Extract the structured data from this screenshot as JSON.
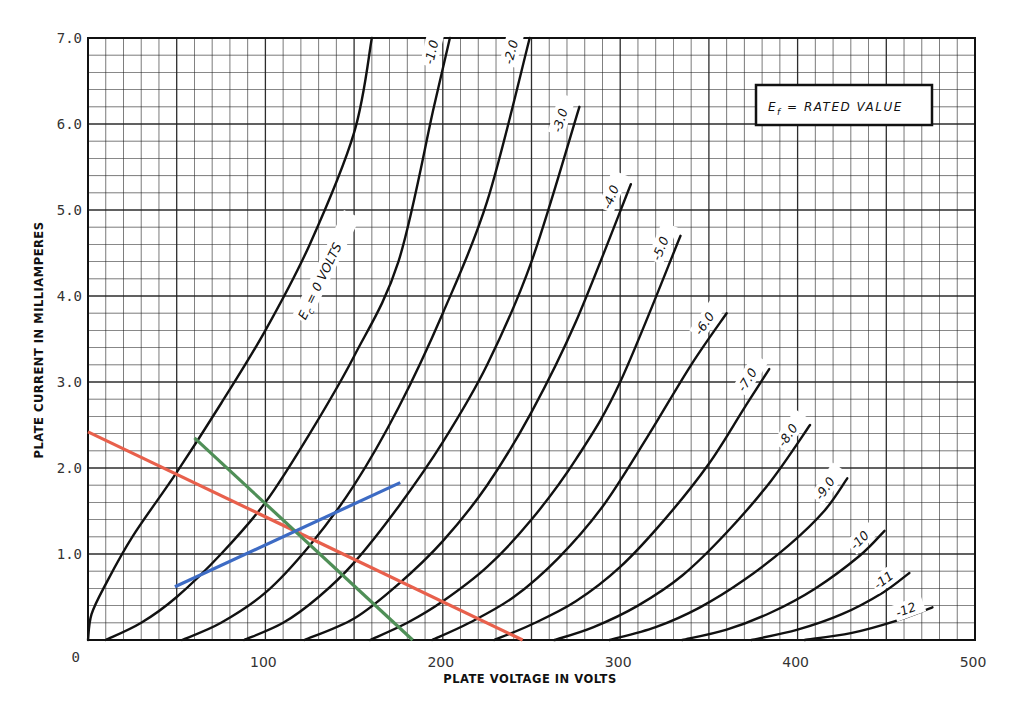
{
  "chart_data": {
    "type": "line",
    "title": "",
    "xlabel": "PLATE VOLTAGE IN VOLTS",
    "ylabel": "PLATE CURRENT IN MILLIAMPERES",
    "xlim": [
      0,
      500
    ],
    "ylim": [
      0,
      7.0
    ],
    "x_ticks": [
      "0",
      "100",
      "200",
      "300",
      "400",
      "500"
    ],
    "y_ticks": [
      "0",
      "1.0",
      "2.0",
      "3.0",
      "4.0",
      "5.0",
      "6.0",
      "7.0"
    ],
    "grid": true,
    "grid_minor_x": 10,
    "grid_minor_y": 0.2,
    "annotation": {
      "text_main": "E",
      "text_sub": "f",
      "text_rest": " = RATED VALUE"
    },
    "series": [
      {
        "name": "Ec = 0 VOLTS",
        "label": "E  = 0 VOLTS",
        "label_sub": "c",
        "points": [
          [
            0,
            0
          ],
          [
            2,
            0.3
          ],
          [
            10,
            0.65
          ],
          [
            25,
            1.2
          ],
          [
            50,
            1.95
          ],
          [
            75,
            2.75
          ],
          [
            100,
            3.6
          ],
          [
            125,
            4.6
          ],
          [
            150,
            5.9
          ],
          [
            160,
            7.0
          ]
        ]
      },
      {
        "name": "-1.0",
        "label": "-1.0",
        "points": [
          [
            10,
            0
          ],
          [
            30,
            0.2
          ],
          [
            50,
            0.5
          ],
          [
            75,
            1.0
          ],
          [
            100,
            1.6
          ],
          [
            125,
            2.4
          ],
          [
            150,
            3.3
          ],
          [
            175,
            4.4
          ],
          [
            195,
            6.2
          ],
          [
            204,
            7.0
          ]
        ]
      },
      {
        "name": "-2.0",
        "label": "-2.0",
        "points": [
          [
            53,
            0
          ],
          [
            75,
            0.2
          ],
          [
            100,
            0.55
          ],
          [
            125,
            1.1
          ],
          [
            150,
            1.8
          ],
          [
            175,
            2.7
          ],
          [
            200,
            3.8
          ],
          [
            225,
            5.1
          ],
          [
            249,
            7.0
          ]
        ]
      },
      {
        "name": "-3.0",
        "label": "-3.0",
        "points": [
          [
            88,
            0
          ],
          [
            110,
            0.2
          ],
          [
            130,
            0.5
          ],
          [
            150,
            0.9
          ],
          [
            175,
            1.55
          ],
          [
            200,
            2.3
          ],
          [
            225,
            3.2
          ],
          [
            250,
            4.4
          ],
          [
            277,
            6.2
          ]
        ]
      },
      {
        "name": "-4.0",
        "label": "-4.0",
        "points": [
          [
            122,
            0
          ],
          [
            150,
            0.25
          ],
          [
            175,
            0.65
          ],
          [
            200,
            1.15
          ],
          [
            225,
            1.8
          ],
          [
            250,
            2.65
          ],
          [
            275,
            3.7
          ],
          [
            306,
            5.3
          ]
        ]
      },
      {
        "name": "-5.0",
        "label": "-5.0",
        "points": [
          [
            159,
            0
          ],
          [
            180,
            0.2
          ],
          [
            200,
            0.45
          ],
          [
            225,
            0.85
          ],
          [
            250,
            1.4
          ],
          [
            275,
            2.1
          ],
          [
            300,
            3.0
          ],
          [
            334,
            4.7
          ]
        ]
      },
      {
        "name": "-6.0",
        "label": "-6.0",
        "points": [
          [
            194,
            0
          ],
          [
            215,
            0.2
          ],
          [
            240,
            0.5
          ],
          [
            265,
            0.95
          ],
          [
            290,
            1.55
          ],
          [
            315,
            2.35
          ],
          [
            340,
            3.2
          ],
          [
            360,
            3.8
          ]
        ]
      },
      {
        "name": "-7.0",
        "label": "-7.0",
        "points": [
          [
            229,
            0
          ],
          [
            250,
            0.18
          ],
          [
            275,
            0.45
          ],
          [
            300,
            0.85
          ],
          [
            325,
            1.4
          ],
          [
            350,
            2.05
          ],
          [
            370,
            2.7
          ],
          [
            384,
            3.15
          ]
        ]
      },
      {
        "name": "-8.0",
        "label": "-8.0",
        "points": [
          [
            263,
            0
          ],
          [
            285,
            0.15
          ],
          [
            310,
            0.4
          ],
          [
            335,
            0.75
          ],
          [
            360,
            1.25
          ],
          [
            385,
            1.85
          ],
          [
            407,
            2.5
          ]
        ]
      },
      {
        "name": "-9.0",
        "label": "-9.0",
        "points": [
          [
            294,
            0
          ],
          [
            320,
            0.15
          ],
          [
            345,
            0.38
          ],
          [
            370,
            0.7
          ],
          [
            395,
            1.1
          ],
          [
            415,
            1.5
          ],
          [
            428,
            1.88
          ]
        ]
      },
      {
        "name": "-10",
        "label": "-10",
        "points": [
          [
            335,
            0
          ],
          [
            360,
            0.12
          ],
          [
            385,
            0.32
          ],
          [
            410,
            0.6
          ],
          [
            435,
            0.98
          ],
          [
            449,
            1.27
          ]
        ]
      },
      {
        "name": "-11",
        "label": "-11",
        "points": [
          [
            374,
            0
          ],
          [
            400,
            0.12
          ],
          [
            425,
            0.3
          ],
          [
            448,
            0.55
          ],
          [
            463,
            0.78
          ]
        ]
      },
      {
        "name": "-12",
        "label": "-12",
        "points": [
          [
            404,
            0
          ],
          [
            430,
            0.08
          ],
          [
            455,
            0.22
          ],
          [
            476,
            0.38
          ]
        ]
      }
    ],
    "overlay_lines": [
      {
        "name": "red-load-line",
        "color": "#e8604c",
        "points": [
          [
            0,
            2.42
          ],
          [
            245,
            0
          ]
        ]
      },
      {
        "name": "green-line",
        "color": "#4f8f57",
        "points": [
          [
            60,
            2.35
          ],
          [
            183,
            0
          ]
        ]
      },
      {
        "name": "blue-line",
        "color": "#3d6bc4",
        "points": [
          [
            49,
            0.62
          ],
          [
            176,
            1.83
          ]
        ]
      }
    ]
  },
  "colors": {
    "grid": "#222222",
    "curve": "#111111",
    "background": "#ffffff"
  }
}
